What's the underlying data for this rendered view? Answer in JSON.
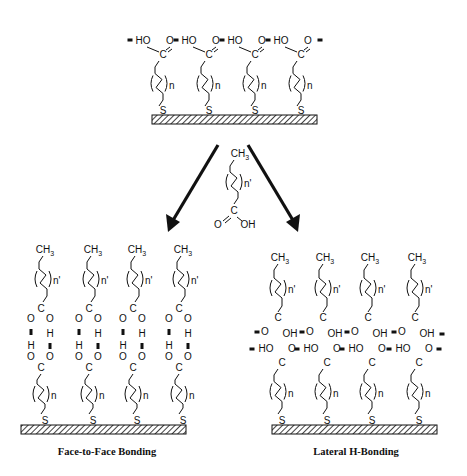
{
  "figure": {
    "top_panel": {
      "name": "carboxylic-acid-terminated-SAM",
      "chains": 4,
      "head_groups": [
        "HO",
        "O"
      ],
      "repeat_label": "n",
      "anchor_atom": "S",
      "carbon_label": "C"
    },
    "reagent": {
      "terminal_group": "CH3",
      "repeat_label": "n'",
      "carbon_label": "C",
      "carbonyl_o": "O",
      "hydroxyl": "OH"
    },
    "left_panel": {
      "caption": "Face-to-Face Bonding",
      "top_label": "CH3",
      "repeat_upper": "n'",
      "repeat_lower": "n",
      "h_label": "H",
      "o_label": "O",
      "carbon_label": "C",
      "anchor_atom": "S"
    },
    "right_panel": {
      "caption": "Lateral H-Bonding",
      "top_label": "CH3",
      "repeat_upper": "n'",
      "repeat_lower": "n",
      "upper_o": "O",
      "upper_oh": "OH",
      "lower_ho": "HO",
      "lower_o": "O",
      "carbon_label": "C",
      "anchor_atom": "S"
    },
    "arrows": [
      {
        "name": "arrow-to-face-to-face",
        "from": [
          222,
          145
        ],
        "to": [
          166,
          232
        ]
      },
      {
        "name": "arrow-to-lateral",
        "from": [
          246,
          145
        ],
        "to": [
          302,
          232
        ]
      }
    ]
  }
}
